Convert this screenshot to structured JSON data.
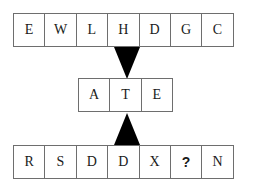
{
  "diagram": {
    "background_color": "#ffffff",
    "cell_border_color": "#6e6e6e",
    "text_color": "#1a1a1a",
    "pointer_color": "#000000",
    "rows": [
      {
        "id": "top-row",
        "cells": [
          "E",
          "W",
          "L",
          "H",
          "D",
          "G",
          "C"
        ],
        "highlighted_index": 3
      },
      {
        "id": "middle-row",
        "cells": [
          "A",
          "T",
          "E"
        ],
        "highlighted_index": 1
      },
      {
        "id": "bottom-row",
        "cells": [
          "R",
          "S",
          "D",
          "D",
          "X",
          "?",
          "N"
        ],
        "highlighted_index": 3
      }
    ],
    "pointers": [
      {
        "id": "pointer-down",
        "direction": "down",
        "from_row": "top-row",
        "to_row": "middle-row",
        "column_letter": "H"
      },
      {
        "id": "pointer-up",
        "direction": "up",
        "from_row": "bottom-row",
        "to_row": "middle-row",
        "column_letter": "D"
      }
    ]
  }
}
